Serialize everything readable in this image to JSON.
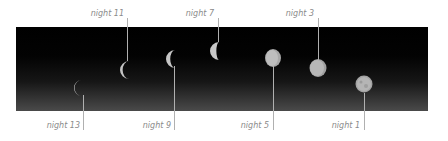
{
  "figure": {
    "labels": [
      {
        "id": "n13",
        "text": "night 13"
      },
      {
        "id": "n11",
        "text": "night 11"
      },
      {
        "id": "n9",
        "text": "night 9"
      },
      {
        "id": "n7",
        "text": "night 7"
      },
      {
        "id": "n5",
        "text": "night 5"
      },
      {
        "id": "n3",
        "text": "night 3"
      },
      {
        "id": "n1",
        "text": "night 1"
      }
    ],
    "colors": {
      "label": "#8a8a8a",
      "leader": "#b0b0b0",
      "sky_top": "#000000",
      "sky_bottom": "#4a4a4a",
      "moon": "#c8c8c8"
    }
  }
}
